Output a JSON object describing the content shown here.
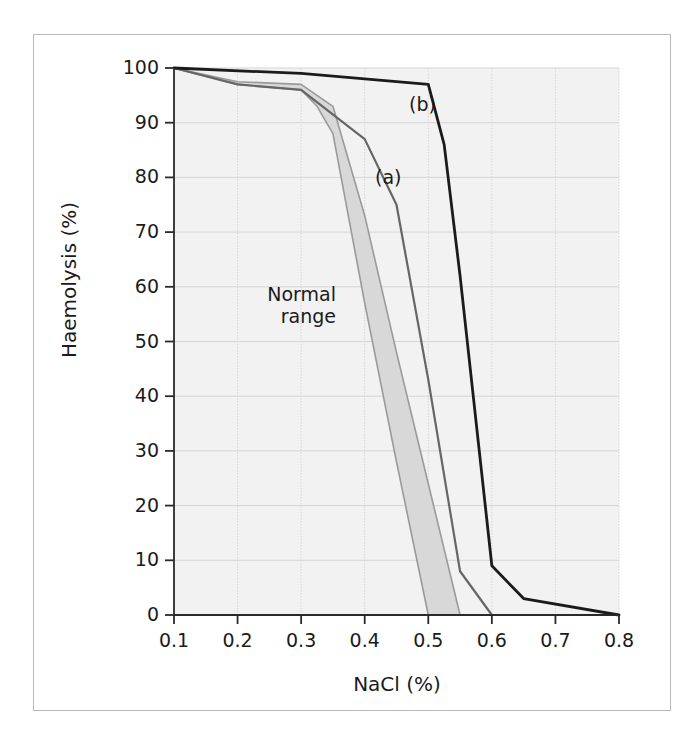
{
  "chart_data": {
    "type": "line",
    "title": "",
    "xlabel": "NaCl (%)",
    "ylabel": "Haemolysis (%)",
    "xlim": [
      0.1,
      0.8
    ],
    "ylim": [
      0,
      100
    ],
    "xticks": [
      "0.1",
      "0.2",
      "0.3",
      "0.4",
      "0.5",
      "0.6",
      "0.7",
      "0.8"
    ],
    "xtick_values": [
      0.1,
      0.2,
      0.3,
      0.4,
      0.5,
      0.6,
      0.7,
      0.8
    ],
    "yticks": [
      "0",
      "10",
      "20",
      "30",
      "40",
      "50",
      "60",
      "70",
      "80",
      "90",
      "100"
    ],
    "ytick_values": [
      0,
      10,
      20,
      30,
      40,
      50,
      60,
      70,
      80,
      90,
      100
    ],
    "grid": true,
    "legend_position": "inline-annotations",
    "series": [
      {
        "name": "(a)",
        "label": "(a)",
        "color": "#666666",
        "linewidth": 2.2,
        "x": [
          0.1,
          0.2,
          0.3,
          0.4,
          0.45,
          0.5,
          0.55,
          0.6
        ],
        "values": [
          100,
          97,
          96,
          87,
          75,
          43,
          8,
          0
        ]
      },
      {
        "name": "(b)",
        "label": "(b)",
        "color": "#1b1b1b",
        "linewidth": 2.8,
        "x": [
          0.1,
          0.3,
          0.5,
          0.525,
          0.55,
          0.6,
          0.65,
          0.8
        ],
        "values": [
          100,
          99,
          97,
          86,
          62,
          9,
          3,
          0
        ]
      }
    ],
    "band": {
      "name": "Normal range",
      "label_line1": "Normal",
      "label_line2": "range",
      "fill": "#d8d8d8",
      "edge": "#9a9a9a",
      "upper_x": [
        0.1,
        0.2,
        0.3,
        0.35,
        0.4,
        0.45,
        0.5,
        0.55
      ],
      "upper_values": [
        100,
        97.5,
        97,
        93,
        73,
        48,
        24,
        0
      ],
      "lower_x": [
        0.1,
        0.2,
        0.3,
        0.325,
        0.35,
        0.4,
        0.45,
        0.5
      ],
      "lower_values": [
        100,
        97,
        96,
        93,
        88,
        57,
        28,
        0
      ]
    },
    "style": {
      "plot_background": "#f2f2f2",
      "gridline_color": "#d5d5d5",
      "axis_color": "#2a2a2a",
      "frame_color": "#b9b9b9",
      "page_background": "#ffffff"
    }
  }
}
